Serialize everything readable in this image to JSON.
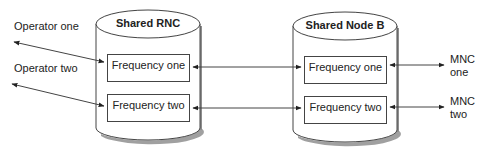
{
  "diagram": {
    "type": "network-architecture",
    "left_labels": {
      "operator_one": "Operator one",
      "operator_two": "Operator two"
    },
    "nodes": [
      {
        "id": "rnc",
        "title": "Shared RNC",
        "boxes": [
          "Frequency one",
          "Frequency two"
        ]
      },
      {
        "id": "nodeb",
        "title": "Shared Node B",
        "boxes": [
          "Frequency one",
          "Frequency two"
        ]
      }
    ],
    "right_labels": {
      "mnc_one": [
        "MNC",
        "one"
      ],
      "mnc_two": [
        "MNC",
        "two"
      ]
    },
    "connections": [
      {
        "from": "Operator one",
        "to": "Shared RNC / Frequency one",
        "direction": "bidirectional"
      },
      {
        "from": "Operator two",
        "to": "Shared RNC / Frequency two",
        "direction": "bidirectional"
      },
      {
        "from": "Shared RNC / Frequency one",
        "to": "Shared Node B / Frequency one",
        "direction": "bidirectional"
      },
      {
        "from": "Shared RNC / Frequency two",
        "to": "Shared Node B / Frequency two",
        "direction": "bidirectional"
      },
      {
        "from": "Shared Node B / Frequency one",
        "to": "MNC one",
        "direction": "bidirectional"
      },
      {
        "from": "Shared Node B / Frequency two",
        "to": "MNC two",
        "direction": "bidirectional"
      }
    ],
    "colors": {
      "stroke": "#444444",
      "shadow": "#9a9a9a",
      "background": "#ffffff",
      "text": "#222222"
    }
  }
}
